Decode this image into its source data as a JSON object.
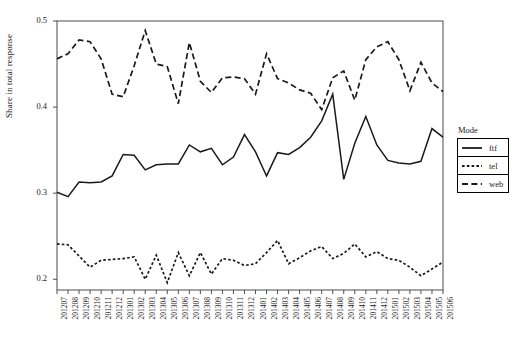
{
  "chart_data": {
    "type": "line",
    "title": "",
    "xlabel": "",
    "ylabel": "Share in total response",
    "ylim": [
      0.1875,
      0.5
    ],
    "ytick_values": [
      0.2,
      0.3,
      0.4,
      0.5
    ],
    "ytick_labels": [
      "0.2",
      "0.3",
      "0.4",
      "0.5"
    ],
    "grid": false,
    "legend_position": "right",
    "legend_title": "Mode",
    "categories": [
      "201207",
      "201208",
      "201209",
      "201210",
      "201211",
      "201212",
      "201301",
      "201302",
      "201303",
      "201304",
      "201305",
      "201306",
      "201307",
      "201308",
      "201309",
      "201310",
      "201311",
      "201312",
      "201401",
      "201402",
      "201403",
      "201404",
      "201405",
      "201406",
      "201407",
      "201408",
      "201409",
      "201410",
      "201411",
      "201412",
      "201501",
      "201502",
      "201503",
      "201504",
      "201505",
      "201506"
    ],
    "series": [
      {
        "name": "ftf",
        "style": "solid",
        "color": "#1a1a1a",
        "values": [
          0.301,
          0.296,
          0.313,
          0.312,
          0.313,
          0.32,
          0.345,
          0.344,
          0.327,
          0.333,
          0.334,
          0.334,
          0.356,
          0.348,
          0.352,
          0.333,
          0.342,
          0.368,
          0.348,
          0.32,
          0.347,
          0.345,
          0.353,
          0.365,
          0.384,
          0.415,
          0.316,
          0.358,
          0.389,
          0.356,
          0.338,
          0.335,
          0.334,
          0.337,
          0.375,
          0.365
        ]
      },
      {
        "name": "tel",
        "style": "dotted",
        "color": "#1a1a1a",
        "values": [
          0.241,
          0.24,
          0.227,
          0.214,
          0.222,
          0.223,
          0.224,
          0.226,
          0.2,
          0.228,
          0.196,
          0.231,
          0.204,
          0.231,
          0.206,
          0.224,
          0.222,
          0.216,
          0.218,
          0.231,
          0.245,
          0.218,
          0.225,
          0.233,
          0.238,
          0.224,
          0.23,
          0.241,
          0.226,
          0.232,
          0.224,
          0.222,
          0.214,
          0.204,
          0.212,
          0.22
        ]
      },
      {
        "name": "web",
        "style": "dashed",
        "color": "#1a1a1a",
        "values": [
          0.456,
          0.462,
          0.478,
          0.476,
          0.456,
          0.415,
          0.412,
          0.448,
          0.489,
          0.45,
          0.447,
          0.404,
          0.475,
          0.43,
          0.417,
          0.434,
          0.435,
          0.433,
          0.415,
          0.462,
          0.433,
          0.428,
          0.42,
          0.416,
          0.397,
          0.434,
          0.442,
          0.408,
          0.455,
          0.47,
          0.476,
          0.455,
          0.419,
          0.452,
          0.428,
          0.418
        ]
      }
    ]
  },
  "legend": {
    "title": "Mode",
    "entries": [
      {
        "label": "ftf",
        "style": "solid"
      },
      {
        "label": "tel",
        "style": "dotted"
      },
      {
        "label": "web",
        "style": "dashed"
      }
    ]
  }
}
